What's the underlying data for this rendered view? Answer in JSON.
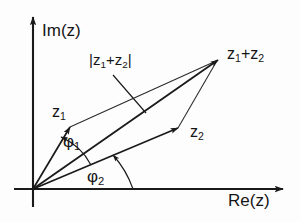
{
  "figure": {
    "background_color": "#fdfdfd",
    "stroke_color": "#1a1a1a",
    "text_color": "#151515"
  },
  "axes": {
    "imaginary": {
      "label": "Im(z)",
      "label_base": "Im(z)",
      "direction": "up"
    },
    "real": {
      "label": "Re(z)",
      "label_base": "Re(z)",
      "direction": "right"
    },
    "origin_label": ""
  },
  "vectors": [
    {
      "name": "z1",
      "label_base": "z",
      "label_sub": "1",
      "tip": [
        70,
        127
      ],
      "origin": [
        33,
        189
      ]
    },
    {
      "name": "z2",
      "label_base": "z",
      "label_sub": "2",
      "tip": [
        178,
        128
      ],
      "origin": [
        33,
        189
      ]
    },
    {
      "name": "z1+z2",
      "label_base": "z",
      "label_sub": "1",
      "label_mid": "+z",
      "label_sub2": "2",
      "tip": [
        218,
        60
      ],
      "origin": [
        33,
        189
      ]
    }
  ],
  "annotations": {
    "magnitude": {
      "prefix": "|z",
      "sub1": "1",
      "mid": "+z",
      "sub2": "2",
      "suffix": "|"
    },
    "angle1": {
      "symbol": "φ",
      "sub": "1"
    },
    "angle2": {
      "symbol": "φ",
      "sub": "2"
    }
  }
}
